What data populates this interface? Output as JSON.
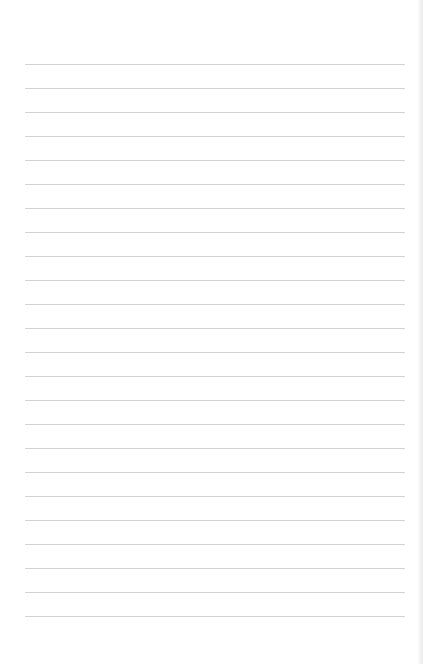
{
  "page": {
    "type": "blank-lined-paper",
    "line_count": 24,
    "first_line_y": 64,
    "line_spacing": 24,
    "line_left": 25,
    "line_width": 380,
    "line_color": "#d2d2d2",
    "background_color": "#ffffff"
  }
}
